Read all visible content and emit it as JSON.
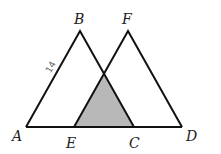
{
  "diagram": {
    "type": "geometry",
    "points": {
      "A": {
        "label": "A",
        "x": 26,
        "y": 127
      },
      "B": {
        "label": "B",
        "x": 80,
        "y": 31
      },
      "C": {
        "label": "C",
        "x": 134,
        "y": 127
      },
      "D": {
        "label": "D",
        "x": 182,
        "y": 127
      },
      "E": {
        "label": "E",
        "x": 74,
        "y": 127
      },
      "F": {
        "label": "F",
        "x": 128,
        "y": 31
      }
    },
    "segment_labels": [
      {
        "segment": "AB",
        "text": "14"
      }
    ],
    "shaded_region": {
      "vertices": [
        "E",
        "intersection of BC and EF",
        "C"
      ],
      "color": "#b8b8b8"
    },
    "line_color": "#111111"
  }
}
